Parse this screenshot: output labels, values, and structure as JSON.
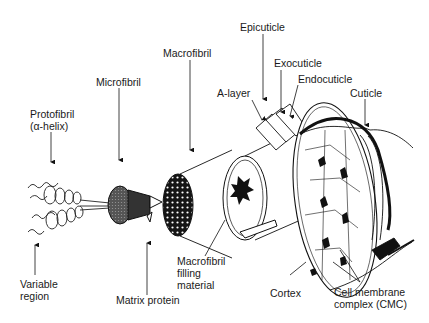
{
  "diagram": {
    "type": "hair-fiber-structure",
    "labels": {
      "protofibril": [
        "Protofibril",
        "(α-helix)"
      ],
      "microfibril": "Microfibril",
      "macrofibril": "Macrofibril",
      "epicuticle": "Epicuticle",
      "exocuticle": "Exocuticle",
      "endocuticle": "Endocuticle",
      "a_layer": "A-layer",
      "cuticle": "Cuticle",
      "variable_region": [
        "Variable",
        "region"
      ],
      "matrix_protein": "Matrix protein",
      "macrofibril_filling": [
        "Macrofibril",
        "filling",
        "material"
      ],
      "cortex": "Cortex",
      "cmc": [
        "Cell membrane",
        "complex (CMC)"
      ]
    },
    "colors": {
      "ink": "#111111",
      "background": "#ffffff",
      "label": "#1a1a1a"
    }
  }
}
